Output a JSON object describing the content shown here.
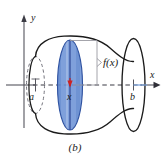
{
  "figure": {
    "caption": "(b)",
    "axes": {
      "x_axis_label": "x",
      "y_axis_label": "y"
    },
    "labels": {
      "lower_limit": "a",
      "upper_limit": "b",
      "sample_point": "x",
      "function_height": "f(x)"
    },
    "colors": {
      "disk_fill": "#6d93d6",
      "disk_stroke": "#2f52a0",
      "outline": "#1a1a1a",
      "axis": "#4a4a52",
      "dashed_axis": "#3b3b44",
      "marker": "#cc2222",
      "background": "#ffffff",
      "leader": "#8d8d95"
    },
    "icons": {
      "x_axis_arrow": "arrow-right-icon",
      "y_axis_arrow": "arrow-up-icon",
      "sample_marker": "center-marker-icon",
      "a_tick": "tick-marker-icon",
      "b_tick": "tick-marker-icon"
    }
  }
}
